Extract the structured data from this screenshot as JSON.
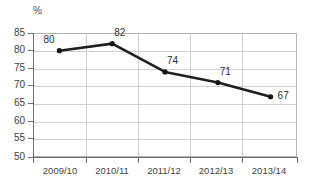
{
  "chart_data": {
    "type": "line",
    "title": "",
    "subtitle": "",
    "xlabel": "",
    "ylabel": "%",
    "unit_label": "%",
    "categories": [
      "2009/10",
      "2010/11",
      "2011/12",
      "2012/13",
      "2013/14"
    ],
    "values": [
      80,
      82,
      74,
      71,
      67
    ],
    "point_labels": [
      "80",
      "82",
      "74",
      "71",
      "67"
    ],
    "series": [
      {
        "name": "",
        "values": [
          80,
          82,
          74,
          71,
          67
        ]
      }
    ],
    "ylim": [
      50,
      85
    ],
    "ytick_step": 5,
    "ytick_labels": [
      "85",
      "80",
      "75",
      "70",
      "65",
      "60",
      "55",
      "50"
    ],
    "ytick_values": [
      85,
      80,
      75,
      70,
      65,
      60,
      55,
      50
    ],
    "grid": {
      "horizontal": true,
      "vertical": true,
      "color": "#cfcfcf"
    },
    "legend": {
      "visible": false,
      "position": "none",
      "entries": []
    },
    "colors": {
      "line": "#1f1f1f",
      "marker": "#151515",
      "grid": "#cfcfcf",
      "axis": "#6e6e6e",
      "plot_border": "#b4b4b4",
      "text": "#3f3f3f",
      "background": "#ffffff"
    },
    "marker_style": "filled-circle",
    "data_labels_visible": true
  }
}
